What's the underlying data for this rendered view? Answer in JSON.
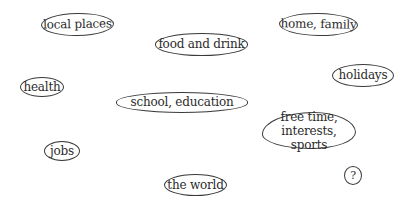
{
  "topics": [
    {
      "id": "local-places",
      "label": "local places"
    },
    {
      "id": "food-and-drink",
      "label": "food and drink"
    },
    {
      "id": "home-family",
      "label": "home, family"
    },
    {
      "id": "holidays",
      "label": "holidays"
    },
    {
      "id": "health",
      "label": "health"
    },
    {
      "id": "school-education",
      "label": "school, education"
    },
    {
      "id": "free-time",
      "label_line1": "free time,",
      "label_line2": "interests, sports"
    },
    {
      "id": "jobs",
      "label": "jobs"
    },
    {
      "id": "the-world",
      "label": "the world"
    },
    {
      "id": "other",
      "label": "?"
    }
  ],
  "colors": {
    "background": "#ffffff",
    "ink": "#2b2b2b",
    "outline": "#3a3a3a"
  }
}
